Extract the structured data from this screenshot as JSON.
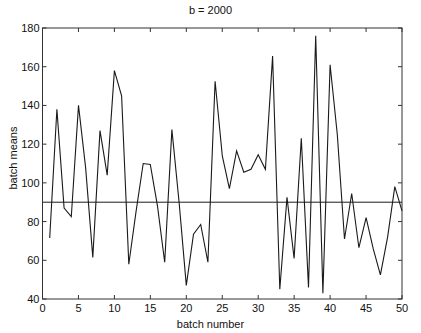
{
  "chart_data": {
    "type": "line",
    "title": "b = 2000",
    "xlabel": "batch number",
    "ylabel": "batch means",
    "xlim": [
      0,
      50
    ],
    "ylim": [
      40,
      180
    ],
    "xticks": [
      0,
      5,
      10,
      15,
      20,
      25,
      30,
      35,
      40,
      45,
      50
    ],
    "yticks": [
      40,
      60,
      80,
      100,
      120,
      140,
      160,
      180
    ],
    "grid": false,
    "legend": null,
    "series": [
      {
        "name": "batch means",
        "x": [
          1,
          2,
          3,
          4,
          5,
          6,
          7,
          8,
          9,
          10,
          11,
          12,
          13,
          14,
          15,
          16,
          17,
          18,
          19,
          20,
          21,
          22,
          23,
          24,
          25,
          26,
          27,
          28,
          29,
          30,
          31,
          32,
          33,
          34,
          35,
          36,
          37,
          38,
          39,
          40,
          41,
          42,
          43,
          44,
          45,
          46,
          47,
          48,
          49,
          50
        ],
        "values": [
          71.5,
          138,
          87,
          82.5,
          140,
          108,
          61.5,
          127,
          104,
          158,
          145,
          58,
          85,
          110,
          109.5,
          88,
          59,
          127.5,
          90,
          47,
          73.5,
          78.5,
          59,
          152.5,
          114,
          97,
          116.5,
          105.5,
          107,
          114.5,
          107,
          165.5,
          45,
          92.5,
          61,
          123,
          46,
          176,
          43,
          161,
          125,
          71,
          94.5,
          66.5,
          82,
          66,
          52.5,
          72,
          98,
          85.5
        ]
      },
      {
        "name": "overall mean",
        "x": [
          0,
          50
        ],
        "values": [
          90,
          90
        ]
      }
    ]
  },
  "labels": {
    "title": "b = 2000",
    "xlabel": "batch number",
    "ylabel": "batch means"
  },
  "colors": {
    "line": "#1a1a1a",
    "axes": "#333333",
    "background": "#ffffff"
  }
}
